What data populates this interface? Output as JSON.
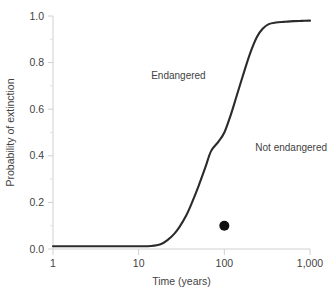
{
  "chart_data": {
    "type": "line",
    "title": "",
    "xlabel": "Time (years)",
    "ylabel": "Probability of extinction",
    "xscale": "log",
    "yscale": "linear",
    "xlim": [
      1,
      1000
    ],
    "ylim": [
      0.0,
      1.0
    ],
    "grid": false,
    "legend": "none",
    "xticks": [
      "1",
      "10",
      "100",
      "1,000"
    ],
    "xtick_values": [
      1,
      10,
      100,
      1000
    ],
    "yticks": [
      "0.0",
      "0.2",
      "0.4",
      "0.6",
      "0.8",
      "1.0"
    ],
    "ytick_values": [
      0.0,
      0.2,
      0.4,
      0.6,
      0.8,
      1.0
    ],
    "series": [
      {
        "name": "extinction-probability-curve",
        "color": "#2b2b2b",
        "x": [
          1,
          2,
          3,
          5,
          7,
          10,
          14,
          18,
          22,
          26,
          30,
          36,
          42,
          50,
          60,
          70,
          85,
          100,
          120,
          140,
          170,
          200,
          240,
          280,
          330,
          400,
          500,
          650,
          800,
          1000
        ],
        "y": [
          0.012,
          0.012,
          0.012,
          0.012,
          0.012,
          0.012,
          0.013,
          0.02,
          0.04,
          0.065,
          0.095,
          0.145,
          0.2,
          0.27,
          0.35,
          0.42,
          0.46,
          0.5,
          0.58,
          0.66,
          0.76,
          0.84,
          0.91,
          0.945,
          0.965,
          0.972,
          0.975,
          0.978,
          0.979,
          0.98
        ]
      }
    ],
    "points": [
      {
        "name": "observed-species-point",
        "x": 100,
        "y": 0.1,
        "color": "#111111",
        "marker": "filled-circle",
        "radius": 5
      }
    ],
    "annotations": [
      {
        "name": "endangered",
        "text": "Endangered",
        "x": 14,
        "y": 0.73
      },
      {
        "name": "not-endangered",
        "text": "Not endangered",
        "x": 230,
        "y": 0.42
      }
    ]
  },
  "axes": {
    "x_title": "Time (years)",
    "y_title": "Probability of extinction"
  },
  "colors": {
    "curve": "#2b2b2b",
    "point": "#111111",
    "axis": "#d0d0d0",
    "text": "#3f3f3f",
    "background": "#ffffff"
  }
}
